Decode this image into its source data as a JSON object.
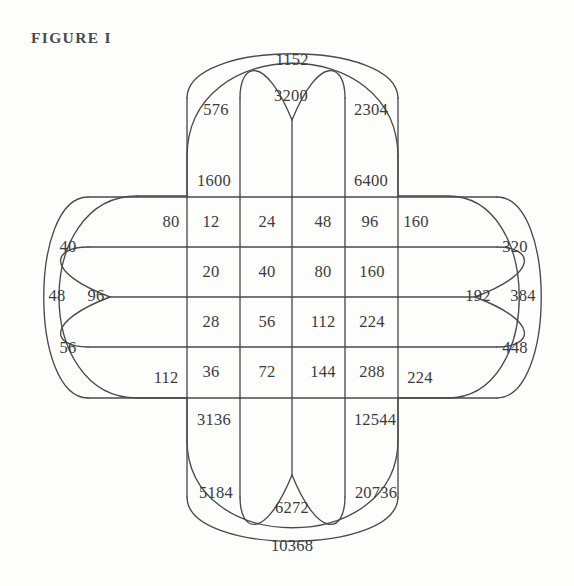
{
  "figure": {
    "title": "FIGURE I",
    "colors": {
      "background": "#fdfdfb",
      "line": "#4a4a4f",
      "text": "#3b3b40",
      "title_text": "#4a4a4f"
    }
  },
  "chart_data": {
    "type": "table",
    "title": "FIGURE I",
    "xlabel": "",
    "ylabel": "",
    "grid": true,
    "legend": "none",
    "core_grid": {
      "rows": 4,
      "cols": 4,
      "values": [
        [
          12,
          24,
          48,
          96
        ],
        [
          20,
          40,
          80,
          160
        ],
        [
          28,
          56,
          112,
          224
        ],
        [
          36,
          72,
          144,
          288
        ]
      ]
    },
    "arm_values": {
      "left": {
        "inner_row_top": 80,
        "inner_row_bottom": 112,
        "loop_inner": 96,
        "loop_mid_top": 40,
        "loop_mid": 48,
        "loop_mid_bottom": 56
      },
      "right": {
        "inner_row_top": 160,
        "inner_row_bottom": 224,
        "loop_inner": 192,
        "loop_mid_top": 320,
        "loop_mid": 384,
        "loop_mid_bottom": 448
      },
      "top": {
        "inner_col_left": 1600,
        "inner_col_right": 6400,
        "loop_inner": 3200,
        "loop_mid_left": 576,
        "loop_mid": 1152,
        "loop_mid_right": 2304
      },
      "bottom": {
        "inner_col_left": 3136,
        "inner_col_right": 12544,
        "loop_inner": 6272,
        "loop_mid_left": 5184,
        "loop_mid": 10368,
        "loop_mid_right": 20736
      }
    },
    "labels": [
      {
        "name": "core-r1c1",
        "text": "12",
        "x": 211,
        "y": 222
      },
      {
        "name": "core-r1c2",
        "text": "24",
        "x": 267,
        "y": 222
      },
      {
        "name": "core-r1c3",
        "text": "48",
        "x": 323,
        "y": 222
      },
      {
        "name": "core-r1c4",
        "text": "96",
        "x": 370,
        "y": 222
      },
      {
        "name": "core-r2c1",
        "text": "20",
        "x": 211,
        "y": 272
      },
      {
        "name": "core-r2c2",
        "text": "40",
        "x": 267,
        "y": 272
      },
      {
        "name": "core-r2c3",
        "text": "80",
        "x": 323,
        "y": 272
      },
      {
        "name": "core-r2c4",
        "text": "160",
        "x": 372,
        "y": 272
      },
      {
        "name": "core-r3c1",
        "text": "28",
        "x": 211,
        "y": 322
      },
      {
        "name": "core-r3c2",
        "text": "56",
        "x": 267,
        "y": 322
      },
      {
        "name": "core-r3c3",
        "text": "112",
        "x": 323,
        "y": 322
      },
      {
        "name": "core-r3c4",
        "text": "224",
        "x": 372,
        "y": 322
      },
      {
        "name": "core-r4c1",
        "text": "36",
        "x": 211,
        "y": 372
      },
      {
        "name": "core-r4c2",
        "text": "72",
        "x": 267,
        "y": 372
      },
      {
        "name": "core-r4c3",
        "text": "144",
        "x": 323,
        "y": 372
      },
      {
        "name": "core-r4c4",
        "text": "288",
        "x": 372,
        "y": 372
      },
      {
        "name": "left-80",
        "text": "80",
        "x": 171,
        "y": 222
      },
      {
        "name": "left-112",
        "text": "112",
        "x": 166,
        "y": 378
      },
      {
        "name": "left-96",
        "text": "96",
        "x": 96,
        "y": 296
      },
      {
        "name": "left-40",
        "text": "40",
        "x": 68,
        "y": 247
      },
      {
        "name": "left-48",
        "text": "48",
        "x": 57,
        "y": 296
      },
      {
        "name": "left-56",
        "text": "56",
        "x": 68,
        "y": 348
      },
      {
        "name": "right-160",
        "text": "160",
        "x": 416,
        "y": 222
      },
      {
        "name": "right-224",
        "text": "224",
        "x": 420,
        "y": 378
      },
      {
        "name": "right-192",
        "text": "192",
        "x": 478,
        "y": 296
      },
      {
        "name": "right-320",
        "text": "320",
        "x": 515,
        "y": 247
      },
      {
        "name": "right-384",
        "text": "384",
        "x": 523,
        "y": 296
      },
      {
        "name": "right-448",
        "text": "448",
        "x": 515,
        "y": 348
      },
      {
        "name": "top-1600",
        "text": "1600",
        "x": 214,
        "y": 181
      },
      {
        "name": "top-6400",
        "text": "6400",
        "x": 371,
        "y": 181
      },
      {
        "name": "top-3200",
        "text": "3200",
        "x": 291,
        "y": 96
      },
      {
        "name": "top-576",
        "text": "576",
        "x": 216,
        "y": 110
      },
      {
        "name": "top-1152",
        "text": "1152",
        "x": 292,
        "y": 60
      },
      {
        "name": "top-2304",
        "text": "2304",
        "x": 371,
        "y": 110
      },
      {
        "name": "bottom-3136",
        "text": "3136",
        "x": 214,
        "y": 420
      },
      {
        "name": "bottom-12544",
        "text": "12544",
        "x": 375,
        "y": 420
      },
      {
        "name": "bottom-6272",
        "text": "6272",
        "x": 292,
        "y": 508
      },
      {
        "name": "bottom-5184",
        "text": "5184",
        "x": 216,
        "y": 493
      },
      {
        "name": "bottom-10368",
        "text": "10368",
        "x": 292,
        "y": 546
      },
      {
        "name": "bottom-20736",
        "text": "20736",
        "x": 376,
        "y": 493
      }
    ]
  }
}
